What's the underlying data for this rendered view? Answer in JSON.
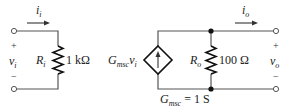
{
  "diagram": {
    "type": "circuit",
    "input_circuit": {
      "current_label": {
        "base": "i",
        "sub": "i"
      },
      "voltage_label": {
        "base": "v",
        "sub": "i"
      },
      "plus_sign": "+",
      "minus_sign": "−",
      "resistor": {
        "name": {
          "base": "R",
          "sub": "i"
        },
        "value": "1 kΩ"
      }
    },
    "output_circuit": {
      "dependent_source": {
        "label": {
          "base": "G",
          "sub": "msc",
          "tail_base": "v",
          "tail_sub": "i"
        },
        "type": "voltage-controlled current source"
      },
      "transconductance_label": {
        "base": "G",
        "sub": "msc",
        "rest": " = 1 S"
      },
      "resistor": {
        "name": {
          "base": "R",
          "sub": "o"
        },
        "value": "100 Ω"
      },
      "current_label": {
        "base": "i",
        "sub": "o"
      },
      "voltage_label": {
        "base": "v",
        "sub": "o"
      },
      "plus_sign": "+",
      "minus_sign": "−"
    }
  }
}
